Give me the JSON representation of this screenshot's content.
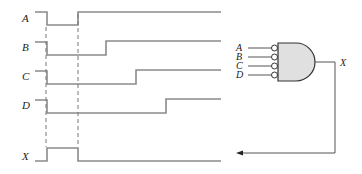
{
  "timing_diagram": {
    "signals": [
      {
        "name": "A",
        "label": "A",
        "waveform": "high-low-high",
        "transitions_x": [
          47,
          78
        ]
      },
      {
        "name": "B",
        "label": "B",
        "waveform": "high-low-high",
        "transitions_x": [
          47,
          106
        ]
      },
      {
        "name": "C",
        "label": "C",
        "waveform": "high-low-high",
        "transitions_x": [
          47,
          136
        ]
      },
      {
        "name": "D",
        "label": "D",
        "waveform": "high-low-high",
        "transitions_x": [
          47,
          166
        ]
      },
      {
        "name": "X",
        "label": "X",
        "waveform": "low-high-low",
        "transitions_x": [
          47,
          78
        ]
      }
    ],
    "dashed_markers_x": [
      47,
      78
    ]
  },
  "gate": {
    "type": "AND",
    "inverted_inputs": true,
    "inputs": [
      "A",
      "B",
      "C",
      "D"
    ],
    "output": "X",
    "fill_color": "#e0e0e0"
  },
  "feedback_arrow": {
    "from": "X output",
    "to": "X waveform"
  }
}
